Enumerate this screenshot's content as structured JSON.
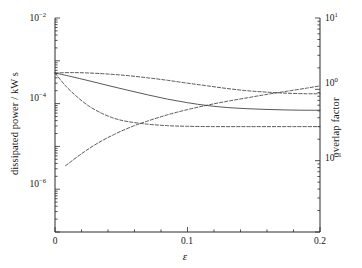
{
  "chart_data": {
    "type": "line",
    "title": "",
    "xlabel": "ε",
    "ylabel": "dissipated power / kW s",
    "ylabel_right": "overlap factor",
    "xlim": [
      0,
      0.2
    ],
    "ylim": [
      1e-07,
      0.01
    ],
    "ylim_right": [
      0.01,
      10
    ],
    "yscale": "log",
    "yscale_right": "log",
    "grid": false,
    "legend": "none",
    "xticks": [
      "0",
      "0.1",
      "0.2"
    ],
    "xtick_values": [
      0,
      0.1,
      0.2
    ],
    "yticks_left": [
      "10⁻²",
      "10⁻⁴",
      "10⁻⁶"
    ],
    "ytick_values_left": [
      0.01,
      0.0001,
      1e-06
    ],
    "yticks_right": [
      "10¹",
      "10⁰",
      "10⁻¹"
    ],
    "ytick_values_right": [
      10,
      1,
      0.1
    ],
    "series": [
      {
        "name": "upper dashed curve",
        "style": "dashed",
        "axis": "left",
        "x": [
          0.0,
          0.012,
          0.025,
          0.04,
          0.055,
          0.07,
          0.085,
          0.1,
          0.115,
          0.13,
          0.145,
          0.16,
          0.175,
          0.19,
          0.2
        ],
        "y": [
          0.00052,
          0.00053,
          0.00052,
          0.00049,
          0.00045,
          0.0004,
          0.00035,
          0.0003,
          0.00026,
          0.000225,
          0.0002,
          0.000185,
          0.000175,
          0.00017,
          0.00017
        ]
      },
      {
        "name": "solid curve",
        "style": "solid",
        "axis": "left",
        "x": [
          0.0,
          0.012,
          0.025,
          0.04,
          0.055,
          0.07,
          0.085,
          0.1,
          0.115,
          0.13,
          0.145,
          0.16,
          0.175,
          0.19,
          0.2
        ],
        "y": [
          0.00052,
          0.00043,
          0.000345,
          0.000265,
          0.000205,
          0.00016,
          0.000127,
          0.000105,
          9e-05,
          8.1e-05,
          7.6e-05,
          7.3e-05,
          7.1e-05,
          7e-05,
          7e-05
        ]
      },
      {
        "name": "steep falling dashed curve",
        "style": "dashed",
        "axis": "left",
        "x": [
          0.0,
          0.008,
          0.016,
          0.025,
          0.035,
          0.045,
          0.055,
          0.07,
          0.085,
          0.1,
          0.12,
          0.14,
          0.16,
          0.18,
          0.2
        ],
        "y": [
          0.00052,
          0.00026,
          0.00015,
          9e-05,
          6e-05,
          4.5e-05,
          3.8e-05,
          3.3e-05,
          3.05e-05,
          2.95e-05,
          2.9e-05,
          2.9e-05,
          2.9e-05,
          2.9e-05,
          2.9e-05
        ]
      },
      {
        "name": "rising dashed curve",
        "style": "dashed",
        "axis": "right",
        "x": [
          0.008,
          0.02,
          0.032,
          0.045,
          0.058,
          0.07,
          0.085,
          0.1,
          0.115,
          0.13,
          0.145,
          0.16,
          0.175,
          0.19,
          0.2
        ],
        "y": [
          0.085,
          0.125,
          0.175,
          0.235,
          0.3,
          0.36,
          0.44,
          0.52,
          0.6,
          0.68,
          0.76,
          0.85,
          0.94,
          1.04,
          1.12
        ]
      }
    ]
  },
  "axes": {
    "left_title": "dissipated power / kW s",
    "right_title": "overlap factor",
    "x_title": "ε",
    "left_ticks": [
      {
        "base": "10",
        "exp": "−2"
      },
      {
        "base": "10",
        "exp": "−4"
      },
      {
        "base": "10",
        "exp": "−6"
      }
    ],
    "right_ticks": [
      {
        "base": "10",
        "exp": "1"
      },
      {
        "base": "10",
        "exp": "0"
      },
      {
        "base": "10",
        "exp": "−1"
      }
    ],
    "x_ticks": [
      "0",
      "0.1",
      "0.2"
    ]
  },
  "colors": {
    "curve": "#3a3a3a",
    "axis": "#2b2b2b",
    "background": "#ffffff",
    "text": "#141414"
  }
}
